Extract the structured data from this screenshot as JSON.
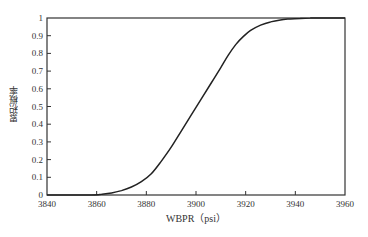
{
  "chart_data": {
    "type": "line",
    "title": "",
    "xlabel": "WBPR（psi）",
    "ylabel": "累积概率",
    "xlim": [
      3840,
      3960
    ],
    "ylim": [
      0,
      1
    ],
    "xticks": [
      3840,
      3860,
      3880,
      3900,
      3920,
      3940,
      3960
    ],
    "yticks": [
      0,
      0.1,
      0.2,
      0.3,
      0.4,
      0.5,
      0.6,
      0.7,
      0.8,
      0.9,
      1
    ],
    "ytick_labels": [
      "0",
      "0.1",
      "0.2",
      "0.3",
      "0.4",
      "0.5",
      "0.6",
      "0.7",
      "0.8",
      "0.9",
      "1"
    ],
    "grid": false,
    "legend": null,
    "series": [
      {
        "name": "CDF",
        "color": "#222222",
        "x": [
          3840,
          3858,
          3862,
          3866,
          3870,
          3874,
          3878,
          3882,
          3886,
          3890,
          3894,
          3898,
          3902,
          3906,
          3910,
          3913,
          3916,
          3919,
          3922,
          3926,
          3930,
          3934,
          3938,
          3942,
          3946,
          3950,
          3960
        ],
        "y": [
          0,
          0,
          0.004,
          0.012,
          0.025,
          0.045,
          0.075,
          0.12,
          0.19,
          0.27,
          0.36,
          0.45,
          0.54,
          0.63,
          0.72,
          0.79,
          0.85,
          0.895,
          0.93,
          0.96,
          0.978,
          0.989,
          0.995,
          0.998,
          0.9995,
          1,
          1
        ]
      }
    ]
  }
}
